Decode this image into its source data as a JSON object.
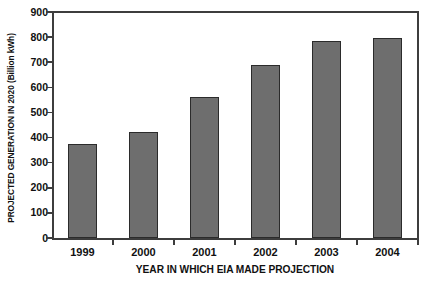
{
  "chart_data": {
    "type": "bar",
    "title": "",
    "subtitle": "",
    "categories": [
      "1999",
      "2000",
      "2001",
      "2002",
      "2003",
      "2004"
    ],
    "values": [
      375,
      422,
      560,
      690,
      785,
      797
    ],
    "xlabel": "YEAR IN WHICH EIA MADE PROJECTION",
    "ylabel": "PROJECTED GENERATION IN 2020 (Billion kWh)",
    "ylim": [
      0,
      900
    ],
    "xlim_categories": 6,
    "yticks": [
      0,
      100,
      200,
      300,
      400,
      500,
      600,
      700,
      800,
      900
    ],
    "ytick_labels": [
      "0",
      "100",
      "200",
      "300",
      "400",
      "500",
      "600",
      "700",
      "800",
      "900"
    ],
    "grid": false,
    "legend": null,
    "annotations": [],
    "colors": {
      "bar_fill": "#6e6e6e",
      "bar_edge": "#2b2b2b",
      "axis": "#3d3d3d",
      "text": "#111111",
      "background": "#ffffff"
    }
  }
}
